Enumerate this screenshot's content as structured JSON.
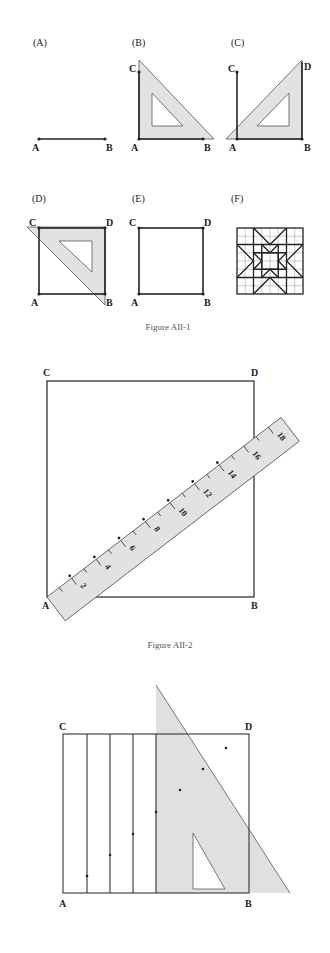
{
  "colors": {
    "ink": "#222222",
    "tool_fill": "#e2e2e2",
    "tool_stroke": "#555555",
    "grid_light": "#9a9a9a",
    "caption": "#555555"
  },
  "figure1": {
    "caption": "Figure AII-1",
    "panels": [
      {
        "id": "A",
        "label": "(A)",
        "points": [
          "A",
          "B"
        ]
      },
      {
        "id": "B",
        "label": "(B)",
        "points": [
          "C",
          "A",
          "B"
        ]
      },
      {
        "id": "C",
        "label": "(C)",
        "points": [
          "C",
          "D",
          "A",
          "B"
        ]
      },
      {
        "id": "D",
        "label": "(D)",
        "points": [
          "C",
          "D",
          "A",
          "B"
        ]
      },
      {
        "id": "E",
        "label": "(E)",
        "points": [
          "C",
          "D",
          "A",
          "B"
        ]
      },
      {
        "id": "F",
        "label": "(F)",
        "points": []
      }
    ]
  },
  "figure2": {
    "caption": "Figure AII-2",
    "corners": {
      "top_left": "C",
      "top_right": "D",
      "bottom_left": "A",
      "bottom_right": "B"
    },
    "ruler_numbers": [
      "2",
      "4",
      "6",
      "8",
      "10",
      "12",
      "14",
      "16",
      "18"
    ]
  },
  "figure3": {
    "corners": {
      "top_left": "C",
      "top_right": "D",
      "bottom_left": "A",
      "bottom_right": "B"
    }
  }
}
